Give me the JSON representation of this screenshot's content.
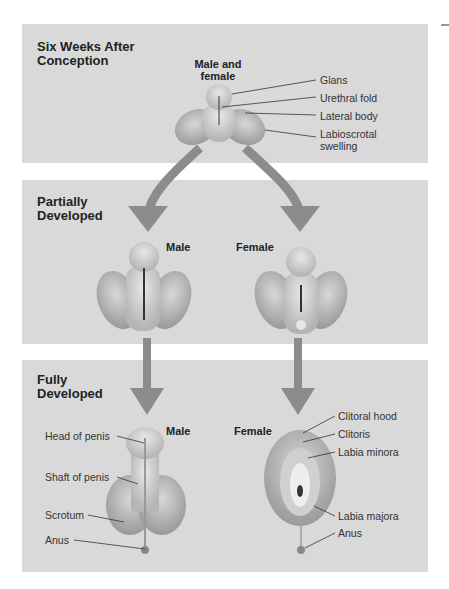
{
  "stages": [
    {
      "title_line1": "Six Weeks After",
      "title_line2": "Conception",
      "subject_line1": "Male and",
      "subject_line2": "female",
      "labels": [
        "Glans",
        "Urethral fold",
        "Lateral body",
        "Labioscrotal",
        "swelling"
      ]
    },
    {
      "title_line1": "Partially",
      "title_line2": "Developed",
      "male": "Male",
      "female": "Female"
    },
    {
      "title_line1": "Fully",
      "title_line2": "Developed",
      "male": "Male",
      "female": "Female",
      "male_labels": [
        "Head of penis",
        "Shaft of penis",
        "Scrotum",
        "Anus"
      ],
      "female_labels": [
        "Clitoral hood",
        "Clitoris",
        "Labia minora",
        "Labia majora",
        "Anus"
      ]
    }
  ],
  "colors": {
    "panel": "#d9d9d9",
    "arrow": "#8c8c8c",
    "tissue": "#a9a9a9",
    "tissue_light": "#d0d0d0"
  }
}
